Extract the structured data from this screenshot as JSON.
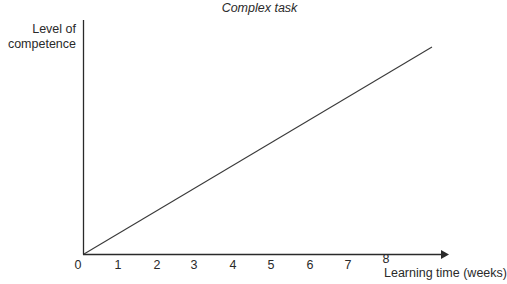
{
  "chart_data": {
    "type": "line",
    "title": "Complex task",
    "xlabel": "Learning time (weeks)",
    "ylabel": "Level of competence",
    "x_ticks": [
      "0",
      "1",
      "2",
      "3",
      "4",
      "5",
      "6",
      "7",
      "8"
    ],
    "y_ticks": [],
    "series": [
      {
        "name": "Competence",
        "x": [
          0,
          9.1
        ],
        "y": [
          0,
          1
        ],
        "note": "straight linear increase from origin; y axis unlabeled (relative competence)"
      }
    ],
    "xlim": [
      0,
      9.4
    ],
    "ylim": [
      0,
      1.1
    ],
    "grid": false,
    "legend": null
  },
  "colors": {
    "axis": "#2a2a2a",
    "line": "#3a3a3a",
    "text": "#2a2a2a"
  }
}
